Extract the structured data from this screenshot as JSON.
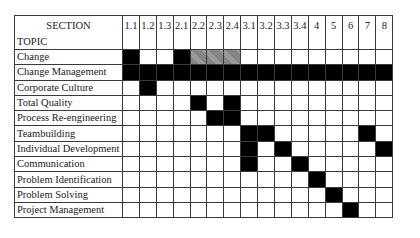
{
  "table": {
    "header": {
      "section_label": "SECTION",
      "topic_label": "TOPIC",
      "sections": [
        "1.1",
        "1.2",
        "1.3",
        "2.1",
        "2.2",
        "2.3",
        "2.4",
        "3.1",
        "3.2",
        "3.3",
        "3.4",
        "4",
        "5",
        "6",
        "7",
        "8"
      ]
    },
    "legend": {
      "filled": "#000000",
      "hatched": "#8a8a8a"
    },
    "rows": [
      {
        "topic": "Change",
        "filled": [
          "1.1",
          "2.1"
        ],
        "hatched": [
          "2.2",
          "2.3",
          "2.4"
        ]
      },
      {
        "topic": "Change Management",
        "filled": [
          "1.1",
          "1.2",
          "1.3",
          "2.1",
          "2.2",
          "2.3",
          "2.4",
          "3.1",
          "3.2",
          "3.3",
          "3.4",
          "4",
          "5",
          "6",
          "7",
          "8"
        ],
        "hatched": []
      },
      {
        "topic": "Corporate Culture",
        "filled": [
          "1.2"
        ],
        "hatched": []
      },
      {
        "topic": "Total Quality",
        "filled": [
          "2.2",
          "2.4"
        ],
        "hatched": []
      },
      {
        "topic": "Process Re-engineering",
        "filled": [
          "2.3",
          "2.4"
        ],
        "hatched": []
      },
      {
        "topic": "Teambuilding",
        "filled": [
          "3.1",
          "3.2",
          "7"
        ],
        "hatched": []
      },
      {
        "topic": "Individual Development",
        "filled": [
          "3.1",
          "3.3",
          "8"
        ],
        "hatched": []
      },
      {
        "topic": "Communication",
        "filled": [
          "3.1",
          "3.4"
        ],
        "hatched": []
      },
      {
        "topic": "Problem Identification",
        "filled": [
          "4"
        ],
        "hatched": []
      },
      {
        "topic": "Problem Solving",
        "filled": [
          "5"
        ],
        "hatched": []
      },
      {
        "topic": "Project Management",
        "filled": [
          "6"
        ],
        "hatched": []
      }
    ]
  }
}
